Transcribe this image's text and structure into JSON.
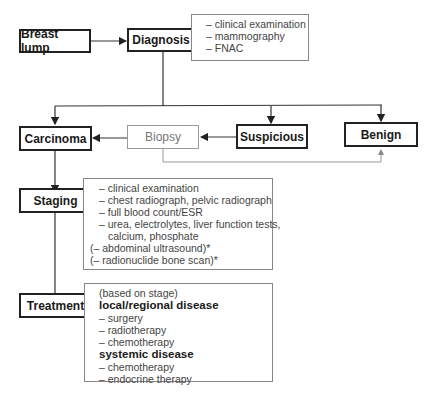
{
  "nodes": {
    "breast_lump": "Breast lump",
    "diagnosis": "Diagnosis",
    "carcinoma": "Carcinoma",
    "biopsy": "Biopsy",
    "suspicious": "Suspicious",
    "benign": "Benign",
    "staging": "Staging",
    "treatment": "Treatment"
  },
  "diagnosis_notes": [
    "– clinical examination",
    "– mammography",
    "– FNAC"
  ],
  "staging_notes": [
    "– clinical examination",
    "– chest radiograph, pelvic radiograph",
    "– full blood count/ESR",
    "– urea, electrolytes, liver function tests,",
    "calcium, phosphate",
    "(– abdominal ultrasound)*",
    "(– radionuclide bone scan)*"
  ],
  "treatment_notes": {
    "intro": "(based on stage)",
    "local_heading": "local/regional disease",
    "local_items": [
      "– surgery",
      "– radiotherapy",
      "– chemotherapy"
    ],
    "systemic_heading": "systemic disease",
    "systemic_items": [
      "– chemotherapy",
      "– endocrine therapy"
    ]
  },
  "colors": {
    "main_border": "#222222",
    "light_border": "#999999",
    "line": "#333333"
  }
}
